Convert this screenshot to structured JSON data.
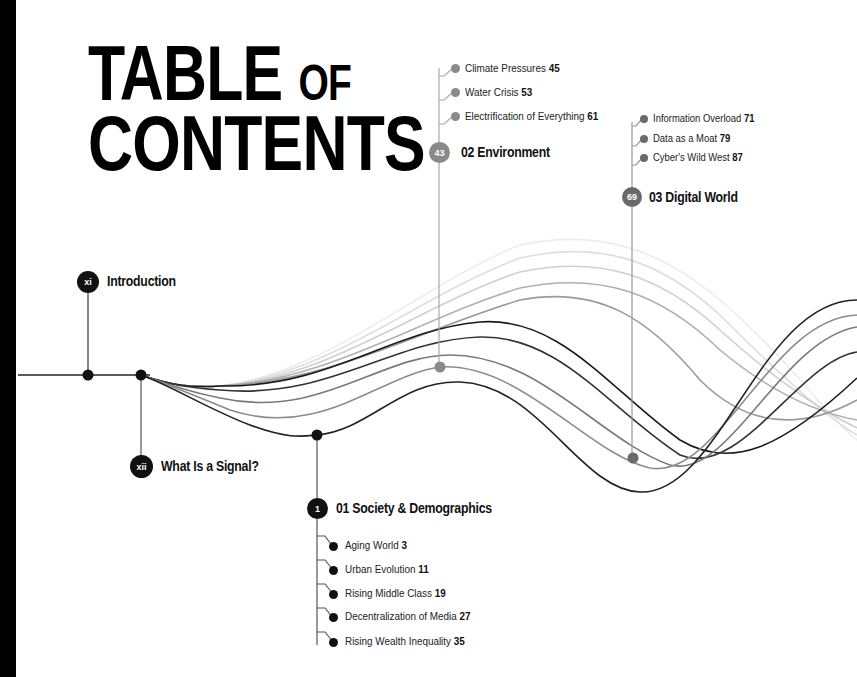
{
  "title": {
    "line1_main": "TABLE",
    "line1_small": "OF",
    "line2": "CONTENTS"
  },
  "front_matter": [
    {
      "badge": "xi",
      "label": "Introduction"
    },
    {
      "badge": "xii",
      "label": "What Is a Signal?"
    }
  ],
  "sections": [
    {
      "badge": "1",
      "label": "01 Society & Demographics",
      "color": "#111111",
      "items": [
        {
          "label": "Aging World",
          "page": "3"
        },
        {
          "label": "Urban Evolution",
          "page": "11"
        },
        {
          "label": "Rising Middle Class",
          "page": "19"
        },
        {
          "label": "Decentralization of Media",
          "page": "27"
        },
        {
          "label": "Rising Wealth Inequality",
          "page": "35"
        }
      ]
    },
    {
      "badge": "43",
      "label": "02 Environment",
      "color": "#8a8a8a",
      "items": [
        {
          "label": "Climate Pressures",
          "page": "45"
        },
        {
          "label": "Water Crisis",
          "page": "53"
        },
        {
          "label": "Electrification of Everything",
          "page": "61"
        }
      ]
    },
    {
      "badge": "69",
      "label": "03 Digital World",
      "color": "#6a6a6a",
      "items": [
        {
          "label": "Information Overload",
          "page": "71"
        },
        {
          "label": "Data as a Moat",
          "page": "79"
        },
        {
          "label": "Cyber's Wild West",
          "page": "87"
        }
      ]
    }
  ],
  "colors": {
    "background": "#ffffff",
    "ink": "#111111",
    "edge_strip": "#000000"
  }
}
